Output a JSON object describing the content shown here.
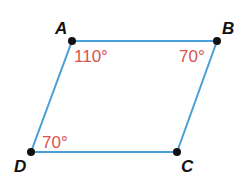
{
  "diagram": {
    "type": "parallelogram",
    "colors": {
      "edge": "#4a9fd8",
      "vertex": "#111111",
      "angle_text": "#d9533f",
      "label_text": "#111111"
    },
    "vertices": [
      {
        "name": "A",
        "x": 72,
        "y": 41
      },
      {
        "name": "B",
        "x": 217,
        "y": 41
      },
      {
        "name": "C",
        "x": 177,
        "y": 152
      },
      {
        "name": "D",
        "x": 31,
        "y": 152
      }
    ],
    "angles": {
      "A": "110°",
      "B": "70°",
      "D": "70°"
    },
    "labels": {
      "A": "A",
      "B": "B",
      "C": "C",
      "D": "D"
    }
  }
}
